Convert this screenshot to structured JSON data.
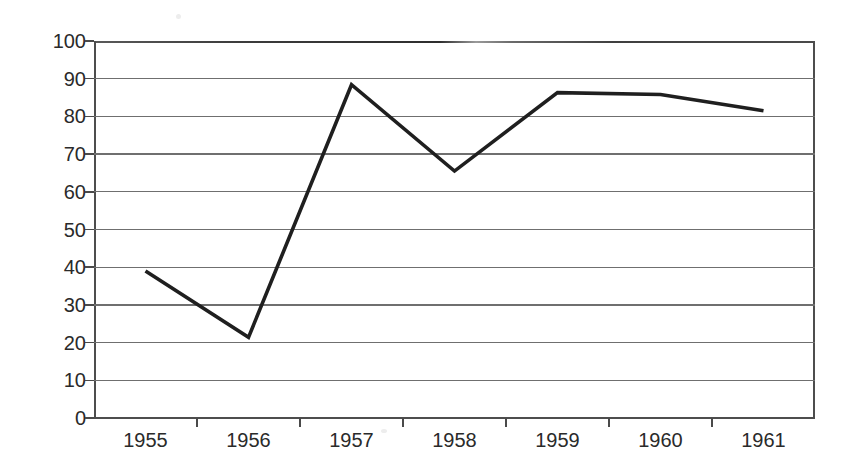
{
  "chart_data": {
    "type": "line",
    "title": "",
    "xlabel": "",
    "ylabel": "Share (%)",
    "categories": [
      "1955",
      "1956",
      "1957",
      "1958",
      "1959",
      "1960",
      "1961"
    ],
    "series": [
      {
        "name": "Share",
        "values": [
          39.0,
          21.4,
          88.4,
          65.5,
          86.3,
          85.8,
          81.5
        ]
      }
    ],
    "ylim": [
      0,
      100
    ],
    "y_ticks": [
      0,
      10,
      20,
      30,
      40,
      50,
      60,
      70,
      80,
      90,
      100
    ],
    "y_tick_labels": [
      "0",
      "10",
      "20",
      "30",
      "40",
      "50",
      "60",
      "70",
      "80",
      "90",
      "100"
    ],
    "grid": "horizontal",
    "legend": "none",
    "line_color": "#1f1f1f",
    "grid_color": "#6f6f6f",
    "axis_color": "#4a4a4a",
    "background_color": "#ffffff"
  }
}
